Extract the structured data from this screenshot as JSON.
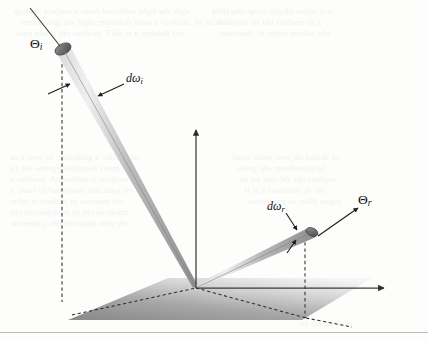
{
  "figure": {
    "caption_labels": {
      "theta_incident": "Θ",
      "theta_incident_sub": "i",
      "theta_reflected": "Θ",
      "theta_reflected_sub": "r",
      "domega_incident_d": "d",
      "domega_incident_omega": "ω",
      "domega_incident_sub": "i",
      "domega_reflected_d": "d",
      "domega_reflected_omega": "ω",
      "domega_reflected_sub": "r"
    },
    "colors": {
      "beam_light": "#e9e9e9",
      "beam_mid": "#b6b6b6",
      "beam_dark": "#8a8a8a",
      "plane_near": "#8f8f8f",
      "plane_far": "#f4f4f4",
      "axis": "#3b3b3b",
      "dashed": "#2e2e2e",
      "rule": "#b9b9b7",
      "background": "#fdfdfc",
      "ghost_text": "#f2f2f0"
    },
    "geometry": {
      "origin_x": 196,
      "origin_y": 288,
      "normal_tip_x": 196,
      "normal_tip_y": 128,
      "incident_tip_x": 62,
      "incident_tip_y": 50,
      "reflected_tip_x": 314,
      "reflected_tip_y": 232,
      "ground_axis_tip_x": 386,
      "ground_axis_tip_y": 288
    }
  },
  "bleed_through_lines": [
    {
      "x": 14,
      "y": 6,
      "text": "ngin the light reflected from a surface nrettap"
    },
    {
      "x": 20,
      "y": 17,
      "text": "a hcus ni ,ecafrus a morf detcelfer thgil eht gnirusaem"
    },
    {
      "x": 16,
      "y": 28,
      "text": "rof dohtem a si sihT .ecafrus eht gnola yaw"
    },
    {
      "x": 212,
      "y": 6,
      "text": "si ti nehw ylralucitrap ,tluciffid"
    },
    {
      "x": 216,
      "y": 17,
      "text": "a fo ecafrus eht no tnedicni"
    },
    {
      "x": 220,
      "y": 28,
      "text": "eht ,sdrow rehto nI .lairetam"
    },
    {
      "x": 10,
      "y": 152,
      "text": "noitcelfer a gniledom fo yaw a sa"
    },
    {
      "x": 10,
      "y": 163,
      "text": "morf detcelfer ygrene eht fo"
    },
    {
      "x": 10,
      "y": 174,
      "text": "ecafrus yrartibra nA .ecafrus a"
    },
    {
      "x": 10,
      "y": 185,
      "text": "eb yam taht snoitcnuf fo ssalc a"
    },
    {
      "x": 10,
      "y": 196,
      "text": "rof tnuocca ot dedeen si tahw"
    },
    {
      "x": 10,
      "y": 207,
      "text": "tnedicni eht fo noitubirtsid eht"
    },
    {
      "x": 10,
      "y": 218,
      "text": "eb yam noitcnuf eht ,yltnerruc"
    },
    {
      "x": 232,
      "y": 152,
      "text": "ni detaol eb yam meht morf"
    },
    {
      "x": 236,
      "y": 163,
      "text": "lacitamehtam eht gnisu"
    },
    {
      "x": 240,
      "y": 174,
      "text": "ecafrus eht )b( dna )a( ni"
    },
    {
      "x": 244,
      "y": 185,
      "text": "eht fo noitcnuf a si tI"
    },
    {
      "x": 248,
      "y": 196,
      "text": "elgna dilos ot gnidrocca"
    },
    {
      "x": 300,
      "y": 318,
      "text": "ecafrus eht fo"
    }
  ]
}
